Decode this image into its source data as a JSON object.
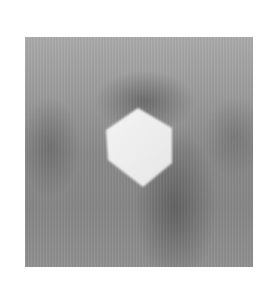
{
  "image": {
    "description": "Grayscale micrograph showing a bright hexagonal crystal on a mottled gray background",
    "background_color": "#9a9a9a",
    "crystal_color": "#f2f2f2"
  }
}
